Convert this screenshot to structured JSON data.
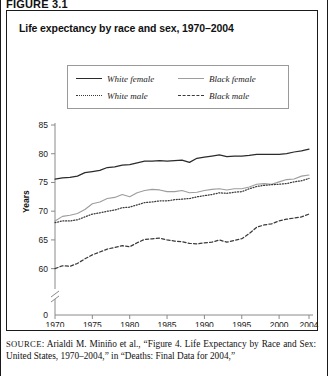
{
  "figure": {
    "label": "FIGURE 3.1",
    "title": "Life expectancy by race and sex, 1970–2004"
  },
  "legend": {
    "position": "top-center-inside",
    "entries": [
      {
        "label": "White female",
        "style": "solid",
        "color": "#2b2b2b"
      },
      {
        "label": "Black female",
        "style": "solid",
        "color": "#9d9d9d"
      },
      {
        "label": "White male",
        "style": "dotted",
        "color": "#3a3a3a"
      },
      {
        "label": "Black male",
        "style": "dashed",
        "color": "#3a3a3a"
      }
    ]
  },
  "source": {
    "keyword": "SOURCE",
    "text": ": Arialdi M. Miniño et al., “Figure 4. Life Expectancy by Race and Sex: United States, 1970–2004,” in “Deaths: Final Data for 2004,”"
  },
  "chart_data": {
    "type": "line",
    "title": "Life expectancy by race and sex, 1970–2004",
    "xlabel": "",
    "ylabel": "Years",
    "xlim": [
      1970,
      2004
    ],
    "ylim": [
      57.5,
      85
    ],
    "y_axis_break": true,
    "y_break_below": 57.5,
    "y_zero_tick": "0",
    "grid": false,
    "xticks": [
      1970,
      1975,
      1980,
      1985,
      1990,
      1995,
      2000,
      2004
    ],
    "xtick_labels": [
      "1970",
      "1975",
      "1980",
      "1985",
      "1990",
      "1995",
      "2000",
      "2004"
    ],
    "yticks": [
      60,
      65,
      70,
      75,
      80,
      85
    ],
    "ytick_labels": [
      "60",
      "65",
      "70",
      "75",
      "80",
      "85"
    ],
    "x": [
      1970,
      1971,
      1972,
      1973,
      1974,
      1975,
      1976,
      1977,
      1978,
      1979,
      1980,
      1981,
      1982,
      1983,
      1984,
      1985,
      1986,
      1987,
      1988,
      1989,
      1990,
      1991,
      1992,
      1993,
      1994,
      1995,
      1996,
      1997,
      1998,
      1999,
      2000,
      2001,
      2002,
      2003,
      2004
    ],
    "series": [
      {
        "name": "White female",
        "style": "solid",
        "color": "#2b2b2b",
        "values": [
          75.6,
          75.8,
          75.9,
          76.1,
          76.7,
          76.9,
          77.1,
          77.6,
          77.7,
          78.0,
          78.1,
          78.4,
          78.7,
          78.7,
          78.8,
          78.7,
          78.8,
          78.9,
          78.5,
          79.2,
          79.4,
          79.6,
          79.8,
          79.5,
          79.6,
          79.6,
          79.7,
          79.9,
          79.9,
          79.9,
          79.9,
          80.0,
          80.3,
          80.5,
          80.8
        ]
      },
      {
        "name": "Black female",
        "style": "solid",
        "color": "#9d9d9d",
        "values": [
          68.3,
          69.1,
          69.3,
          69.6,
          70.3,
          71.3,
          71.6,
          72.2,
          72.4,
          72.9,
          72.5,
          73.2,
          73.6,
          73.8,
          73.7,
          73.4,
          73.4,
          73.6,
          73.2,
          73.3,
          73.6,
          73.8,
          73.9,
          73.7,
          73.9,
          73.9,
          74.2,
          74.7,
          74.8,
          74.7,
          75.1,
          75.5,
          75.6,
          76.1,
          76.3
        ]
      },
      {
        "name": "White male",
        "style": "dotted",
        "color": "#3a3a3a",
        "values": [
          68.0,
          68.3,
          68.3,
          68.5,
          69.0,
          69.5,
          69.7,
          70.0,
          70.2,
          70.6,
          70.7,
          71.1,
          71.5,
          71.6,
          71.8,
          71.8,
          72.0,
          72.1,
          72.2,
          72.5,
          72.7,
          72.9,
          73.2,
          73.1,
          73.3,
          73.4,
          73.9,
          74.3,
          74.5,
          74.6,
          74.7,
          74.8,
          75.1,
          75.3,
          75.7
        ]
      },
      {
        "name": "Black male",
        "style": "dashed",
        "color": "#3a3a3a",
        "values": [
          60.0,
          60.5,
          60.4,
          60.9,
          61.7,
          62.4,
          62.9,
          63.4,
          63.7,
          64.0,
          63.8,
          64.5,
          65.1,
          65.2,
          65.3,
          65.0,
          64.8,
          64.7,
          64.4,
          64.3,
          64.5,
          64.6,
          65.0,
          64.6,
          64.9,
          65.2,
          66.1,
          67.2,
          67.6,
          67.8,
          68.3,
          68.6,
          68.8,
          69.0,
          69.5
        ]
      }
    ]
  }
}
